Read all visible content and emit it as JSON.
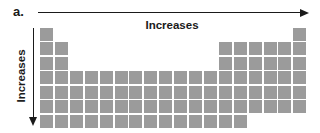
{
  "figure": {
    "label": "a.",
    "top_arrow": {
      "label": "Increases",
      "direction": "right"
    },
    "left_arrow": {
      "label": "Increases",
      "direction": "down"
    }
  },
  "colors": {
    "square": "#9b9b9b",
    "ink": "#1a1a1a",
    "background": "#ffffff"
  },
  "grid": {
    "columns": 18,
    "row_count": 7,
    "rows": [
      {
        "segments": [
          [
            1,
            1
          ],
          [
            18,
            18
          ]
        ]
      },
      {
        "segments": [
          [
            1,
            2
          ],
          [
            13,
            18
          ]
        ]
      },
      {
        "segments": [
          [
            1,
            2
          ],
          [
            13,
            18
          ]
        ]
      },
      {
        "segments": [
          [
            1,
            18
          ]
        ]
      },
      {
        "segments": [
          [
            1,
            18
          ]
        ]
      },
      {
        "segments": [
          [
            1,
            18
          ]
        ]
      },
      {
        "segments": [
          [
            1,
            14
          ]
        ]
      }
    ]
  }
}
